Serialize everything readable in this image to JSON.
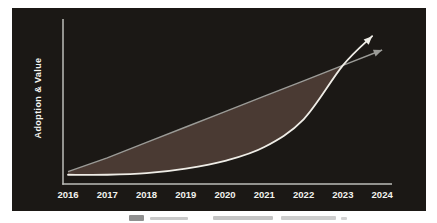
{
  "figure": {
    "outer_background": "#ffffff",
    "plot_background": "#1b1815",
    "axis_color": "#bdbdb8"
  },
  "chart_data": {
    "type": "line",
    "categories": [
      "2016",
      "2017",
      "2018",
      "2019",
      "2020",
      "2021",
      "2022",
      "2023",
      "2024"
    ],
    "ylabel": "Adoption & Value",
    "ylim": [
      0,
      100
    ],
    "grid": false,
    "legend": "none",
    "series": [
      {
        "name": "exponential-adoption-curve",
        "style": "curved",
        "arrow": true,
        "color": "#efede7",
        "values": [
          6,
          6,
          7,
          10,
          15,
          24,
          42,
          77,
          96
        ]
      },
      {
        "name": "linear-expectation-line",
        "style": "straight",
        "arrow": true,
        "color": "#9b9b97",
        "values": [
          8,
          17,
          27,
          37,
          47,
          57,
          67,
          77,
          87
        ]
      }
    ],
    "fill_between": {
      "upper": "linear-expectation-line",
      "lower": "exponential-adoption-curve",
      "until_category": "2023",
      "color": "#4a3a33"
    },
    "annotations": []
  }
}
